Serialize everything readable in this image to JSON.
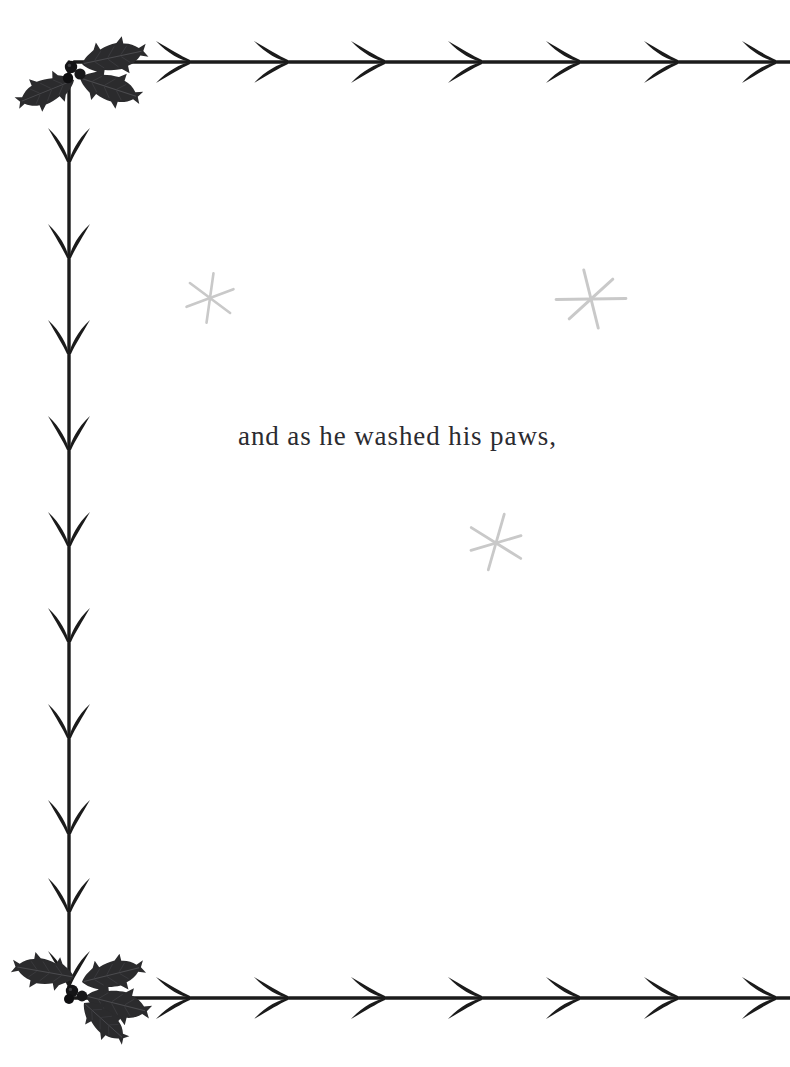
{
  "page": {
    "width": 790,
    "height": 1067,
    "background_color": "#ffffff",
    "kind": "illustrated-storybook-page"
  },
  "text": {
    "body_line": "and as he washed his paws,",
    "color": "#2b2b30",
    "font_size_px": 27,
    "x": 238,
    "baseline_y": 453
  },
  "border": {
    "ink_color": "#1b1b1b",
    "style": "barbed-vine",
    "top": {
      "name": "top-barbed-vine-border",
      "y": 62,
      "x_start": 75,
      "x_end": 790,
      "thorn_direction": "left",
      "thorn_count": 7,
      "thorn_spacing_px": 95
    },
    "left": {
      "name": "left-barbed-vine-border",
      "x": 69,
      "y_start": 62,
      "y_end": 1000,
      "thorn_direction": "up",
      "thorn_count": 10,
      "thorn_spacing_px": 95
    },
    "bottom": {
      "name": "bottom-barbed-vine-border",
      "y": 998,
      "x_start": 75,
      "x_end": 790,
      "thorn_direction": "left",
      "thorn_count": 7,
      "thorn_spacing_px": 95
    }
  },
  "ornaments": {
    "holly_color": "#2a2a2c",
    "berry_color": "#141416",
    "clusters": [
      {
        "name": "holly-cluster-top-left",
        "x": 88,
        "y": 72,
        "leaf_count": 3,
        "berry_count": 3,
        "rotation_deg": 0
      },
      {
        "name": "holly-cluster-bottom-left",
        "x": 92,
        "y": 988,
        "leaf_count": 3,
        "berry_count": 3,
        "rotation_deg": 0
      }
    ]
  },
  "sparkles": {
    "color": "#c9c9c9",
    "shape": "six-pointed-star",
    "items": [
      {
        "name": "sparkle-star-left",
        "cx": 210,
        "cy": 298,
        "size": 26,
        "rotation_deg": 8
      },
      {
        "name": "sparkle-star-right",
        "cx": 591,
        "cy": 299,
        "size": 35,
        "rotation_deg": -14
      },
      {
        "name": "sparkle-star-center",
        "cx": 496,
        "cy": 543,
        "size": 31,
        "rotation_deg": 16
      }
    ]
  }
}
